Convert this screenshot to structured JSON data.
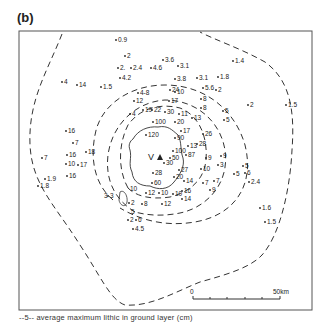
{
  "panel_label": "(b)",
  "vent_label": "V",
  "legend_text": "--5-- average maximum lithic in ground layer (cm)",
  "scale_bar": {
    "start_label": "0",
    "end_label": "50km"
  },
  "contour_labels": [
    "3",
    "5",
    "10"
  ],
  "points": [
    {
      "v": "0.9",
      "x": 118,
      "y": 42
    },
    {
      "v": "2",
      "x": 127,
      "y": 58
    },
    {
      "v": "2.",
      "x": 120,
      "y": 70
    },
    {
      "v": "2.4",
      "x": 133,
      "y": 70
    },
    {
      "v": "4.6",
      "x": 153,
      "y": 70
    },
    {
      "v": "3.6",
      "x": 165,
      "y": 62
    },
    {
      "v": "3.1",
      "x": 180,
      "y": 68
    },
    {
      "v": "4.2",
      "x": 122,
      "y": 80
    },
    {
      "v": "4",
      "x": 64,
      "y": 84
    },
    {
      "v": "14",
      "x": 79,
      "y": 87
    },
    {
      "v": "1.5",
      "x": 103,
      "y": 89
    },
    {
      "v": "1.4",
      "x": 235,
      "y": 63
    },
    {
      "v": "3.8",
      "x": 177,
      "y": 81
    },
    {
      "v": "3.1",
      "x": 199,
      "y": 80
    },
    {
      "v": "1.8",
      "x": 220,
      "y": 79
    },
    {
      "v": "5.6",
      "x": 205,
      "y": 90
    },
    {
      "v": "2",
      "x": 218,
      "y": 92
    },
    {
      "v": "4-8",
      "x": 140,
      "y": 95
    },
    {
      "v": "12",
      "x": 136,
      "y": 103
    },
    {
      "v": "24",
      "x": 172,
      "y": 92
    },
    {
      "v": "17",
      "x": 171,
      "y": 103
    },
    {
      "v": "10",
      "x": 177,
      "y": 94
    },
    {
      "v": "8",
      "x": 203,
      "y": 101
    },
    {
      "v": "8",
      "x": 203,
      "y": 110
    },
    {
      "v": "2",
      "x": 250,
      "y": 107
    },
    {
      "v": "1.5",
      "x": 288,
      "y": 107
    },
    {
      "v": "5",
      "x": 225,
      "y": 113
    },
    {
      "v": "5",
      "x": 226,
      "y": 122
    },
    {
      "v": "4",
      "x": 132,
      "y": 116
    },
    {
      "v": "19",
      "x": 145,
      "y": 112
    },
    {
      "v": "22",
      "x": 154,
      "y": 112
    },
    {
      "v": "30",
      "x": 167,
      "y": 114
    },
    {
      "v": "11",
      "x": 181,
      "y": 116
    },
    {
      "v": "13",
      "x": 194,
      "y": 120
    },
    {
      "v": "100",
      "x": 155,
      "y": 124
    },
    {
      "v": "20",
      "x": 177,
      "y": 124
    },
    {
      "v": "17",
      "x": 183,
      "y": 133
    },
    {
      "v": "120",
      "x": 148,
      "y": 137
    },
    {
      "v": "90",
      "x": 177,
      "y": 140
    },
    {
      "v": "26",
      "x": 205,
      "y": 136
    },
    {
      "v": "28",
      "x": 199,
      "y": 146
    },
    {
      "v": "13",
      "x": 190,
      "y": 148
    },
    {
      "v": "16",
      "x": 68,
      "y": 133
    },
    {
      "v": "7",
      "x": 75,
      "y": 145
    },
    {
      "v": "16",
      "x": 69,
      "y": 157
    },
    {
      "v": "18",
      "x": 88,
      "y": 154
    },
    {
      "v": "10",
      "x": 68,
      "y": 166
    },
    {
      "v": "17",
      "x": 80,
      "y": 167
    },
    {
      "v": "16",
      "x": 69,
      "y": 178
    },
    {
      "v": "7",
      "x": 44,
      "y": 160
    },
    {
      "v": "1.9",
      "x": 47,
      "y": 181
    },
    {
      "v": "1.8",
      "x": 40,
      "y": 188
    },
    {
      "v": "100",
      "x": 175,
      "y": 153
    },
    {
      "v": "87",
      "x": 188,
      "y": 157
    },
    {
      "v": "9",
      "x": 208,
      "y": 160
    },
    {
      "v": "9",
      "x": 223,
      "y": 158
    },
    {
      "v": "3",
      "x": 220,
      "y": 167
    },
    {
      "v": "30",
      "x": 166,
      "y": 165
    },
    {
      "v": "50",
      "x": 172,
      "y": 160
    },
    {
      "v": "27",
      "x": 181,
      "y": 172
    },
    {
      "v": "28",
      "x": 155,
      "y": 175
    },
    {
      "v": "20",
      "x": 176,
      "y": 179
    },
    {
      "v": "14",
      "x": 186,
      "y": 183
    },
    {
      "v": "10",
      "x": 203,
      "y": 171
    },
    {
      "v": "7",
      "x": 205,
      "y": 185
    },
    {
      "v": "7",
      "x": 216,
      "y": 183
    },
    {
      "v": "9",
      "x": 212,
      "y": 192
    },
    {
      "v": "5",
      "x": 245,
      "y": 168
    },
    {
      "v": "6",
      "x": 247,
      "y": 175
    },
    {
      "v": "5",
      "x": 236,
      "y": 176
    },
    {
      "v": "2.4",
      "x": 251,
      "y": 184
    },
    {
      "v": "60",
      "x": 154,
      "y": 185
    },
    {
      "v": "12",
      "x": 148,
      "y": 195
    },
    {
      "v": "10",
      "x": 161,
      "y": 195
    },
    {
      "v": "10",
      "x": 175,
      "y": 196
    },
    {
      "v": "16",
      "x": 184,
      "y": 193
    },
    {
      "v": "14",
      "x": 184,
      "y": 201
    },
    {
      "v": "12",
      "x": 164,
      "y": 206
    },
    {
      "v": "3",
      "x": 110,
      "y": 198
    },
    {
      "v": "2",
      "x": 131,
      "y": 205
    },
    {
      "v": "8",
      "x": 144,
      "y": 206
    },
    {
      "v": "2",
      "x": 130,
      "y": 222
    },
    {
      "v": "6",
      "x": 138,
      "y": 222
    },
    {
      "v": "4.5",
      "x": 135,
      "y": 231
    },
    {
      "v": "1.6",
      "x": 262,
      "y": 210
    },
    {
      "v": "1.5",
      "x": 267,
      "y": 224
    }
  ]
}
